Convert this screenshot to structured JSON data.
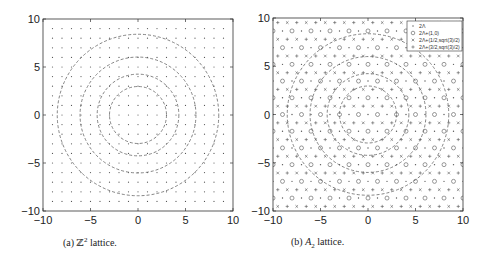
{
  "chart_data": [
    {
      "type": "scatter",
      "title": "",
      "caption": "(a) Z² lattice.",
      "xlim": [
        -10,
        10
      ],
      "ylim": [
        -10,
        10
      ],
      "xticks": [
        -10,
        -5,
        0,
        5,
        10
      ],
      "yticks": [
        -10,
        -5,
        0,
        5,
        10
      ],
      "series": [
        {
          "name": "Z^2 lattice points",
          "marker": "dot",
          "grid_spacing": 1,
          "range": [
            -9,
            9
          ]
        }
      ],
      "circles": [
        {
          "center": [
            0,
            0
          ],
          "radius": 3,
          "style": "dashed"
        },
        {
          "center": [
            0,
            0
          ],
          "radius": 4.3,
          "style": "dashed"
        },
        {
          "center": [
            0,
            0
          ],
          "radius": 6.1,
          "style": "dashed"
        },
        {
          "center": [
            0,
            0
          ],
          "radius": 8.5,
          "style": "dashed"
        }
      ],
      "legend": null,
      "grid": false
    },
    {
      "type": "scatter",
      "title": "",
      "caption": "(b) A₂ lattice.",
      "xlim": [
        -10,
        10
      ],
      "ylim": [
        -10,
        10
      ],
      "xticks": [
        -10,
        -5,
        0,
        5,
        10
      ],
      "yticks": [
        -10,
        -5,
        0,
        5,
        10
      ],
      "series": [
        {
          "name": "2Λ",
          "marker": "dot",
          "offset": [
            0,
            0
          ]
        },
        {
          "name": "2Λ+(1,0)",
          "marker": "circle",
          "offset": [
            1,
            0
          ]
        },
        {
          "name": "2Λ+(1/2,sqrt(3)/2)",
          "marker": "x",
          "offset": [
            0.5,
            0.866
          ]
        },
        {
          "name": "2Λ+(3/2,sqrt(3)/2)",
          "marker": "plus",
          "offset": [
            1.5,
            0.866
          ]
        }
      ],
      "circles": [
        {
          "center": [
            0,
            0
          ],
          "radius": 3,
          "style": "dashed"
        },
        {
          "center": [
            0,
            0
          ],
          "radius": 4.3,
          "style": "dashed"
        },
        {
          "center": [
            0,
            0
          ],
          "radius": 6.1,
          "style": "dashed"
        },
        {
          "center": [
            0,
            0
          ],
          "radius": 8.5,
          "style": "dashed"
        }
      ],
      "legend": {
        "position": "upper right"
      },
      "grid": false
    }
  ],
  "captions": {
    "a_prefix": "(a) ",
    "a_symbol": "ℤ",
    "a_sup": "2",
    "a_suffix": " lattice.",
    "b_prefix": "(b) ",
    "b_symbol": "A",
    "b_sub": "2",
    "b_suffix": " lattice."
  }
}
